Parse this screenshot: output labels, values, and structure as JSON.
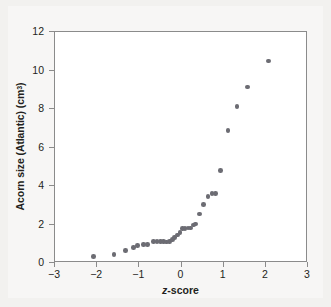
{
  "figure": {
    "background_color": "#f2f1ef",
    "panel_color": "#f7f6f5",
    "plot_background": "#ffffff",
    "frame_color": "#8b8b8b",
    "marker_color": "#6c6c73"
  },
  "axes": {
    "y_label_main": "Acorn size (Atlantic) (cm",
    "y_label_sup": "3",
    "y_label_close": ")",
    "x_label_italic": "z",
    "x_label_rest": "-score",
    "y_ticks": [
      "0",
      "2",
      "4",
      "6",
      "8",
      "10",
      "12"
    ],
    "x_ticks": [
      "−3",
      "−2",
      "−1",
      "0",
      "1",
      "2",
      "3"
    ]
  },
  "chart_data": {
    "type": "scatter",
    "title": "",
    "xlabel": "z-score",
    "ylabel": "Acorn size (Atlantic) (cm3)",
    "xlim": [
      -3,
      3
    ],
    "ylim": [
      0,
      12
    ],
    "xticks": [
      -3,
      -2,
      -1,
      0,
      1,
      2,
      3
    ],
    "yticks": [
      0,
      2,
      4,
      6,
      8,
      10,
      12
    ],
    "grid": false,
    "legend": "none",
    "marker_color": "#6c6c73",
    "series": [
      {
        "name": "Atlantic acorn size normal quantile plot",
        "x": [
          -2.08,
          -1.6,
          -1.33,
          -1.14,
          -1.0,
          -0.88,
          -0.78,
          -0.68,
          -0.6,
          -0.52,
          -0.45,
          -0.38,
          -0.32,
          -0.26,
          -0.2,
          -0.14,
          -0.08,
          -0.03,
          0.03,
          0.08,
          0.14,
          0.2,
          0.26,
          0.32,
          0.38,
          0.45,
          0.52,
          0.6,
          0.68,
          0.78,
          0.88,
          1.0,
          1.14,
          1.33,
          1.6,
          2.08
        ],
        "y": [
          0.35,
          0.45,
          0.65,
          0.8,
          0.92,
          0.95,
          1.1,
          1.12,
          1.12,
          1.12,
          1.12,
          1.1,
          1.12,
          1.2,
          1.35,
          1.48,
          1.6,
          1.8,
          1.82,
          1.82,
          1.85,
          1.85,
          2.0,
          2.05,
          2.55,
          3.05,
          3.45,
          3.6,
          3.62,
          4.82,
          6.88,
          8.13,
          9.15,
          10.5,
          0.95,
          1.12
        ]
      }
    ]
  },
  "points": [
    {
      "x": -2.08,
      "y": 0.35
    },
    {
      "x": -1.6,
      "y": 0.45
    },
    {
      "x": -1.33,
      "y": 0.65
    },
    {
      "x": -1.14,
      "y": 0.8
    },
    {
      "x": -1.05,
      "y": 0.92
    },
    {
      "x": -0.9,
      "y": 0.95
    },
    {
      "x": -0.8,
      "y": 0.95
    },
    {
      "x": -0.67,
      "y": 1.12
    },
    {
      "x": -0.58,
      "y": 1.12
    },
    {
      "x": -0.5,
      "y": 1.12
    },
    {
      "x": -0.42,
      "y": 1.12
    },
    {
      "x": -0.35,
      "y": 1.1
    },
    {
      "x": -0.28,
      "y": 1.12
    },
    {
      "x": -0.22,
      "y": 1.22
    },
    {
      "x": -0.16,
      "y": 1.32
    },
    {
      "x": -0.1,
      "y": 1.45
    },
    {
      "x": -0.04,
      "y": 1.58
    },
    {
      "x": 0.02,
      "y": 1.78
    },
    {
      "x": 0.08,
      "y": 1.8
    },
    {
      "x": 0.15,
      "y": 1.82
    },
    {
      "x": 0.22,
      "y": 1.82
    },
    {
      "x": 0.28,
      "y": 1.98
    },
    {
      "x": 0.33,
      "y": 2.02
    },
    {
      "x": 0.42,
      "y": 2.55
    },
    {
      "x": 0.52,
      "y": 3.05
    },
    {
      "x": 0.63,
      "y": 3.45
    },
    {
      "x": 0.72,
      "y": 3.6
    },
    {
      "x": 0.8,
      "y": 3.62
    },
    {
      "x": 0.92,
      "y": 4.82
    },
    {
      "x": 1.1,
      "y": 6.88
    },
    {
      "x": 1.32,
      "y": 8.13
    },
    {
      "x": 1.57,
      "y": 9.15
    },
    {
      "x": 2.07,
      "y": 10.5
    }
  ]
}
